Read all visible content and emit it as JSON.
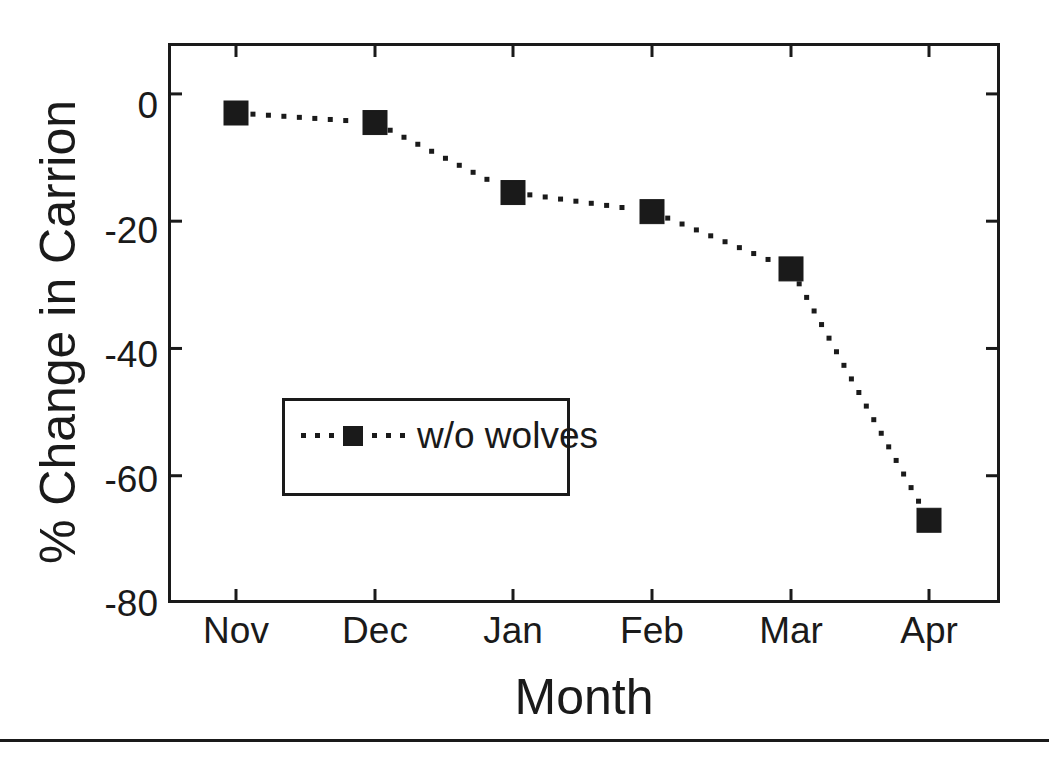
{
  "chart_data": {
    "type": "line",
    "title": "",
    "subtitle": "",
    "xlabel": "Month",
    "ylabel": "% Change in Carrion",
    "categories": [
      "Nov",
      "Dec",
      "Jan",
      "Feb",
      "Mar",
      "Apr"
    ],
    "series": [
      {
        "name": "w/o wolves",
        "values": [
          -3,
          -4.5,
          -15.5,
          -18.5,
          -27.5,
          -67
        ],
        "marker": "filled-square",
        "linestyle": "dotted",
        "color": "#1a1a1a"
      }
    ],
    "ylim": [
      -80,
      8
    ],
    "yticks": [
      0,
      -20,
      -40,
      -60,
      -80
    ],
    "ytick_labels": [
      "0",
      "-20",
      "-40",
      "-60",
      "-80"
    ],
    "xtick_labels": [
      "Nov",
      "Dec",
      "Jan",
      "Feb",
      "Mar",
      "Apr"
    ],
    "grid": false,
    "legend": {
      "position": "center-left-inside",
      "entries": [
        "w/o wolves"
      ]
    },
    "axis_color": "#1a1a1a",
    "background": "#ffffff"
  },
  "legend": {
    "entry_label": "w/o wolves"
  },
  "axes": {
    "x_title": "Month",
    "y_title": "% Change in Carrion"
  },
  "yticks": [
    {
      "label": "0"
    },
    {
      "label": "-20"
    },
    {
      "label": "-40"
    },
    {
      "label": "-60"
    },
    {
      "label": "-80"
    }
  ],
  "xticks": [
    {
      "label": "Nov"
    },
    {
      "label": "Dec"
    },
    {
      "label": "Jan"
    },
    {
      "label": "Feb"
    },
    {
      "label": "Mar"
    },
    {
      "label": "Apr"
    }
  ]
}
